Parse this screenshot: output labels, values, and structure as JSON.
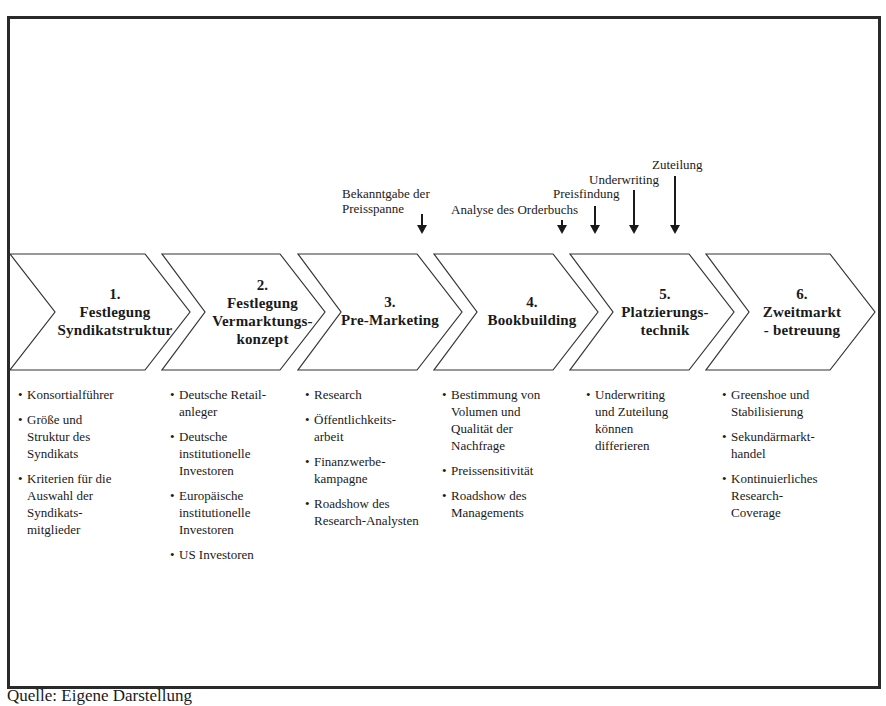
{
  "diagram": {
    "type": "process-chevron",
    "annotations": [
      {
        "label": "Bekanntgabe der\nPreisspanne",
        "line1": "Bekanntgabe der",
        "line2": "Preisspanne"
      },
      {
        "label": "Analyse des Orderbuchs"
      },
      {
        "label": "Preisfindung"
      },
      {
        "label": "Underwriting"
      },
      {
        "label": "Zuteilung"
      }
    ],
    "stages": [
      {
        "number": "1.",
        "lines": [
          "Festlegung",
          "Syndikatstruktur"
        ],
        "items": [
          [
            "Konsortialführer"
          ],
          [
            "Größe und",
            "Struktur des",
            "Syndikats"
          ],
          [
            "Kriterien für die",
            "Auswahl der",
            "Syndikats-",
            "mitglieder"
          ]
        ]
      },
      {
        "number": "2.",
        "lines": [
          "Festlegung",
          "Vermarktungs-",
          "konzept"
        ],
        "items": [
          [
            "Deutsche Retail-",
            "anleger"
          ],
          [
            "Deutsche",
            "institutionelle",
            "Investoren"
          ],
          [
            "Europäische",
            "institutionelle",
            "Investoren"
          ],
          [
            "US Investoren"
          ]
        ]
      },
      {
        "number": "3.",
        "lines": [
          "Pre-Marketing"
        ],
        "items": [
          [
            "Research"
          ],
          [
            "Öffentlichkeits-",
            "arbeit"
          ],
          [
            "Finanzwerbe-",
            "kampagne"
          ],
          [
            "Roadshow des",
            "Research-Analysten"
          ]
        ]
      },
      {
        "number": "4.",
        "lines": [
          "Bookbuilding"
        ],
        "items": [
          [
            "Bestimmung von",
            "Volumen und",
            "Qualität der",
            "Nachfrage"
          ],
          [
            "Preissensitivität"
          ],
          [
            "Roadshow des",
            "Managements"
          ]
        ]
      },
      {
        "number": "5.",
        "lines": [
          "Platzierungs-",
          "technik"
        ],
        "items": [
          [
            "Underwriting",
            "und Zuteilung",
            "können",
            "differieren"
          ]
        ]
      },
      {
        "number": "6.",
        "lines": [
          "Zweitmarkt",
          "-  betreuung"
        ],
        "items": [
          [
            "Greenshoe und",
            "Stabilisierung"
          ],
          [
            "Sekundärmarkt-",
            "handel"
          ],
          [
            "Kontinuierliches",
            "Research-",
            "Coverage"
          ]
        ]
      }
    ],
    "bullet": "•",
    "source": "Quelle: Eigene Darstellung"
  }
}
